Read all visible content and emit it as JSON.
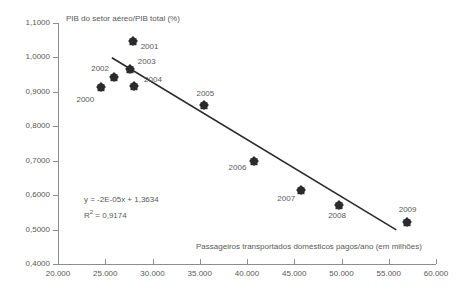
{
  "chart_data": {
    "type": "scatter",
    "title": "",
    "ylabel": "PIB do setor aéreo/PIB total (%)",
    "xlabel": "Passageiros transportados domésticos pagos/ano (em milhões)",
    "xlim": [
      20000,
      60000
    ],
    "ylim": [
      0.4,
      1.1
    ],
    "grid": false,
    "legend": null,
    "xticks": [
      "20.000",
      "25.000",
      "30.000",
      "35.000",
      "40.000",
      "45.000",
      "50.000",
      "55.000",
      "60.000"
    ],
    "xtick_values": [
      20000,
      25000,
      30000,
      35000,
      40000,
      45000,
      50000,
      55000,
      60000
    ],
    "yticks": [
      "0,4000",
      "0,5000",
      "0,6000",
      "0,7000",
      "0,8000",
      "0,9000",
      "1,0000",
      "1,1000"
    ],
    "ytick_values": [
      0.4,
      0.5,
      0.6,
      0.7,
      0.8,
      0.9,
      1.0,
      1.1
    ],
    "points": [
      {
        "label": "2000",
        "x": 24600,
        "y": 0.913,
        "label_dx": -16,
        "label_dy": 13
      },
      {
        "label": "2001",
        "x": 27900,
        "y": 1.048,
        "label_dx": 17,
        "label_dy": 6
      },
      {
        "label": "2002",
        "x": 25950,
        "y": 0.942,
        "label_dx": -14,
        "label_dy": -8
      },
      {
        "label": "2003",
        "x": 27600,
        "y": 0.967,
        "label_dx": 17,
        "label_dy": -7
      },
      {
        "label": "2004",
        "x": 28050,
        "y": 0.916,
        "label_dx": 19,
        "label_dy": -6
      },
      {
        "label": "2005",
        "x": 35500,
        "y": 0.861,
        "label_dx": 1,
        "label_dy": -11
      },
      {
        "label": "2006",
        "x": 40700,
        "y": 0.699,
        "label_dx": -16,
        "label_dy": 7
      },
      {
        "label": "2007",
        "x": 45750,
        "y": 0.615,
        "label_dx": -15,
        "label_dy": 9
      },
      {
        "label": "2008",
        "x": 49750,
        "y": 0.572,
        "label_dx": -2,
        "label_dy": 11
      },
      {
        "label": "2009",
        "x": 56900,
        "y": 0.522,
        "label_dx": 1,
        "label_dy": -12
      }
    ],
    "trendline": {
      "equation": "y = -2E-05x + 1,3634",
      "r_squared": "R² = 0,9174",
      "r_squared_base": "R",
      "r_squared_sup": "2",
      "r_squared_rest": " = 0,9174",
      "x_start": 25700,
      "x_end": 55800,
      "y_start": 0.999,
      "y_end": 0.499
    }
  }
}
